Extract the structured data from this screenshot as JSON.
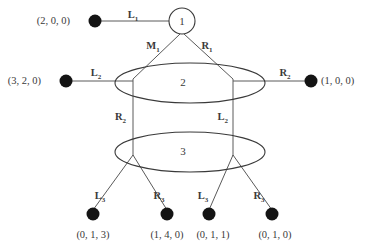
{
  "diagram": {
    "nodes": [
      {
        "id": "n1",
        "label": "1",
        "shape": "circle",
        "cx": 182,
        "cy": 21,
        "r": 13
      },
      {
        "id": "n2",
        "label": "2",
        "shape": "ellipse",
        "cx": 190,
        "cy": 83,
        "rx": 75,
        "ry": 20
      },
      {
        "id": "n3",
        "label": "3",
        "shape": "ellipse",
        "cx": 190,
        "cy": 152,
        "rx": 75,
        "ry": 20
      }
    ],
    "terminals": [
      {
        "id": "t1",
        "label": "(2, 0, 0)",
        "cx": 95,
        "cy": 21,
        "label_x": 70,
        "label_y": 24,
        "anchor": "end"
      },
      {
        "id": "t2",
        "label": "(3, 2, 0)",
        "cx": 66,
        "cy": 81,
        "label_x": 41,
        "label_y": 84,
        "anchor": "end"
      },
      {
        "id": "t3",
        "label": "(1, 0, 0)",
        "cx": 311,
        "cy": 81,
        "label_x": 321,
        "label_y": 84,
        "anchor": "start"
      },
      {
        "id": "t4",
        "label": "(0, 1, 3)",
        "cx": 93,
        "cy": 214,
        "label_x": 93,
        "label_y": 238,
        "anchor": "middle"
      },
      {
        "id": "t5",
        "label": "(1, 4, 0)",
        "cx": 167,
        "cy": 214,
        "label_x": 167,
        "label_y": 238,
        "anchor": "middle"
      },
      {
        "id": "t6",
        "label": "(0, 1, 1)",
        "cx": 209,
        "cy": 214,
        "label_x": 213,
        "label_y": 238,
        "anchor": "middle"
      },
      {
        "id": "t7",
        "label": "(0, 1, 0)",
        "cx": 272,
        "cy": 214,
        "label_x": 275,
        "label_y": 238,
        "anchor": "middle"
      }
    ],
    "edge_labels": [
      {
        "id": "e-l1",
        "base": "L",
        "sub": "1",
        "x": 133,
        "y": 18,
        "anchor": "middle"
      },
      {
        "id": "e-m1",
        "base": "M",
        "sub": "1",
        "x": 153,
        "y": 49,
        "anchor": "middle"
      },
      {
        "id": "e-r1",
        "base": "R",
        "sub": "1",
        "x": 207,
        "y": 49,
        "anchor": "middle"
      },
      {
        "id": "e-l2a",
        "base": "L",
        "sub": "2",
        "x": 96,
        "y": 76,
        "anchor": "middle"
      },
      {
        "id": "e-r2a",
        "base": "R",
        "sub": "2",
        "x": 285,
        "y": 76,
        "anchor": "middle"
      },
      {
        "id": "e-r2b",
        "base": "R",
        "sub": "2",
        "x": 126,
        "y": 120,
        "anchor": "end"
      },
      {
        "id": "e-l2b",
        "base": "L",
        "sub": "2",
        "x": 228,
        "y": 120,
        "anchor": "end"
      },
      {
        "id": "e-l3a",
        "base": "L",
        "sub": "3",
        "x": 100,
        "y": 199,
        "anchor": "middle"
      },
      {
        "id": "e-r3a",
        "base": "R",
        "sub": "3",
        "x": 159,
        "y": 199,
        "anchor": "middle"
      },
      {
        "id": "e-l3b",
        "base": "L",
        "sub": "3",
        "x": 203,
        "y": 199,
        "anchor": "middle"
      },
      {
        "id": "e-r3b",
        "base": "R",
        "sub": "3",
        "x": 259,
        "y": 199,
        "anchor": "middle"
      }
    ],
    "edges": [
      {
        "id": "edge-t1-n1",
        "x1": 95,
        "y1": 21,
        "x2": 169,
        "y2": 21
      },
      {
        "id": "edge-n1-left",
        "x1": 180,
        "y1": 34,
        "x2": 133,
        "y2": 79
      },
      {
        "id": "edge-n1-right",
        "x1": 184,
        "y1": 34,
        "x2": 233,
        "y2": 79
      },
      {
        "id": "edge-t2-n2",
        "x1": 66,
        "y1": 81,
        "x2": 133,
        "y2": 81
      },
      {
        "id": "edge-n2-t3",
        "x1": 233,
        "y1": 81,
        "x2": 311,
        "y2": 81
      },
      {
        "id": "edge-n2-n3-left",
        "x1": 133,
        "y1": 79,
        "x2": 133,
        "y2": 156
      },
      {
        "id": "edge-n2-n3-right",
        "x1": 233,
        "y1": 79,
        "x2": 233,
        "y2": 156
      },
      {
        "id": "edge-n3-t4",
        "x1": 133,
        "y1": 155,
        "x2": 93,
        "y2": 210
      },
      {
        "id": "edge-n3-t5",
        "x1": 133,
        "y1": 155,
        "x2": 167,
        "y2": 210
      },
      {
        "id": "edge-n3-t6",
        "x1": 233,
        "y1": 155,
        "x2": 209,
        "y2": 210
      },
      {
        "id": "edge-n3-t7",
        "x1": 233,
        "y1": 155,
        "x2": 272,
        "y2": 210
      }
    ]
  },
  "style": {
    "edge_color": "#5a5a5a",
    "outline_color": "#3a3a3a",
    "dot_color": "#141414",
    "text_color": "#3a3a3a",
    "background": "#ffffff",
    "dot_radius": 6.5
  }
}
